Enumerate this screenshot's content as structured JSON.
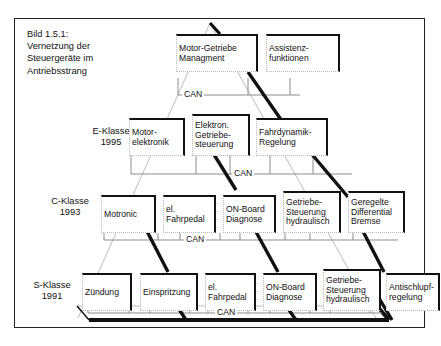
{
  "figure": {
    "caption": "Bild 1.5.1:\nVernetzung der\nSteuergeräte im\nAntriebsstrang",
    "bus_label": "CAN",
    "frame_color": "#222222",
    "node_border_color": "#111111",
    "bus_line_color": "#8c8c8c",
    "pyramid_outline_color": "#bdbdbd",
    "connector_color": "#111111"
  },
  "levels": [
    {
      "id": "level-1",
      "label": "",
      "nodes": [
        {
          "id": "motor-getriebe-managment",
          "text": "Motor-Getriebe\nManagment"
        },
        {
          "id": "assistenzfunktionen",
          "text": "Assistenz-\nfunktionen"
        }
      ],
      "bus_label": "CAN"
    },
    {
      "id": "level-2",
      "label": "E-Klasse\n1995",
      "nodes": [
        {
          "id": "motorelektronik",
          "text": "Motor-\nelektronik"
        },
        {
          "id": "elektron-getriebesteuerung",
          "text": "Elektron.\nGetriebe-\nsteuerung"
        },
        {
          "id": "fahrdynamik-regelung",
          "text": "Fahrdynamik-\nRegelung"
        }
      ],
      "bus_label": "CAN"
    },
    {
      "id": "level-3",
      "label": "C-Klasse\n1993",
      "nodes": [
        {
          "id": "motronic",
          "text": "Motronic"
        },
        {
          "id": "el-fahrpedal-c",
          "text": "el.\nFahrpedal"
        },
        {
          "id": "on-board-diagnose-c",
          "text": "ON-Board\nDiagnose"
        },
        {
          "id": "getriebesteuerung-hydraulisch-c",
          "text": "Getriebe-\nSteuerung\nhydraulisch"
        },
        {
          "id": "geregelte-differential-bremse",
          "text": "Geregelte\nDifferential\nBremse"
        }
      ],
      "bus_label": "CAN"
    },
    {
      "id": "level-4",
      "label": "S-Klasse\n1991",
      "nodes": [
        {
          "id": "zuendung",
          "text": "Zündung"
        },
        {
          "id": "einspritzung",
          "text": "Einspritzung"
        },
        {
          "id": "el-fahrpedal-s",
          "text": "el.\nFahrpedal"
        },
        {
          "id": "on-board-diagnose-s",
          "text": "ON-Board\nDiagnose"
        },
        {
          "id": "getriebesteuerung-hydraulisch-s",
          "text": "Getriebe-\nSteuerung\nhydraulisch"
        },
        {
          "id": "antischlupfregelung",
          "text": "Antischlupf-\nregelung"
        }
      ],
      "bus_label": "CAN"
    }
  ]
}
